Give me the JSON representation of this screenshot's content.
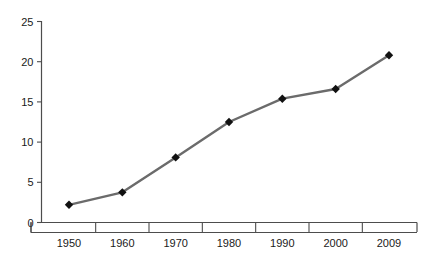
{
  "chart_data": {
    "type": "line",
    "title": "",
    "subtitle": "",
    "xlabel": "",
    "ylabel": "",
    "categories": [
      "1950",
      "1960",
      "1970",
      "1980",
      "1990",
      "2000",
      "2009"
    ],
    "values": [
      2.2,
      3.75,
      8.1,
      12.5,
      15.4,
      16.6,
      20.8
    ],
    "series": [
      {
        "name": "",
        "values": [
          2.2,
          3.75,
          8.1,
          12.5,
          15.4,
          16.6,
          20.8
        ]
      }
    ],
    "ylim": [
      0,
      25
    ],
    "y_ticks": [
      "0",
      "5",
      "10",
      "15",
      "20",
      "25"
    ],
    "y_tick_values": [
      0,
      5,
      10,
      15,
      20,
      25
    ],
    "x_ticks": [
      "1950",
      "1960",
      "1970",
      "1980",
      "1990",
      "2000",
      "2009"
    ],
    "grid": false,
    "legend": "none",
    "marker": "diamond",
    "colors": {
      "line": "#6b6b6b",
      "marker": "#111111",
      "axis": "#4d4d4d",
      "text": "#1a1a1a",
      "background": "#ffffff"
    }
  },
  "axes": {
    "y_axis_name": "y-axis",
    "x_axis_name": "x-axis"
  }
}
